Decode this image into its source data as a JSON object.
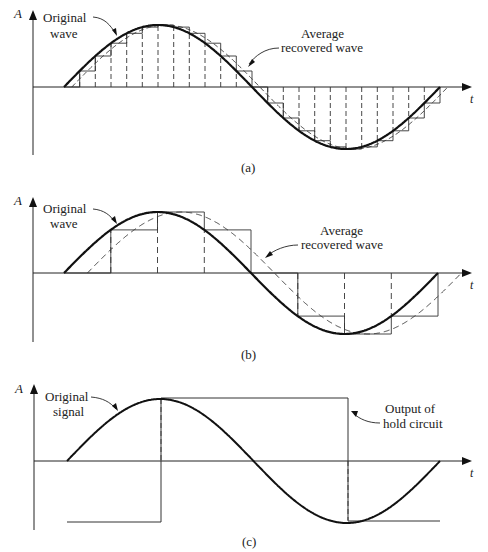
{
  "figure": {
    "panels": [
      {
        "id": "a",
        "caption": "(a)",
        "axis_y_label": "A",
        "axis_x_label": "t",
        "annotation_left": [
          "Original",
          "wave"
        ],
        "annotation_right": [
          "Average",
          "recovered wave"
        ],
        "samples_per_period": 24,
        "description": "Sine wave sampled at high rate with sample-and-hold staircase closely following original"
      },
      {
        "id": "b",
        "caption": "(b)",
        "axis_y_label": "A",
        "axis_x_label": "t",
        "annotation_left": [
          "Original",
          "wave"
        ],
        "annotation_right": [
          "Average",
          "recovered wave"
        ],
        "samples_per_period": 8,
        "description": "Sine wave sampled at lower rate; staircase and dashed average recovered wave lag the original"
      },
      {
        "id": "c",
        "caption": "(c)",
        "axis_y_label": "A",
        "axis_x_label": "t",
        "annotation_left": [
          "Original",
          "signal"
        ],
        "annotation_right": [
          "Output of",
          "hold circuit"
        ],
        "samples_per_period": 2,
        "description": "Sine sampled at twice per period; hold output is a square wave"
      }
    ],
    "colors": {
      "curve": "#111111",
      "staircase": "#333333",
      "dashed": "#333333",
      "axis": "#222222",
      "text": "#222222"
    }
  }
}
